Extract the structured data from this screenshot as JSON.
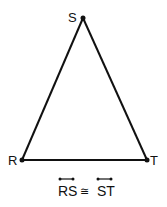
{
  "diagram": {
    "type": "isosceles-triangle",
    "vertices": [
      {
        "label": "S",
        "x": 83,
        "y": 18
      },
      {
        "label": "R",
        "x": 22,
        "y": 160
      },
      {
        "label": "T",
        "x": 147,
        "y": 160
      }
    ],
    "caption": {
      "left": "RS",
      "symbol": "≅",
      "right": "ST"
    },
    "stroke_color": "#111111"
  }
}
